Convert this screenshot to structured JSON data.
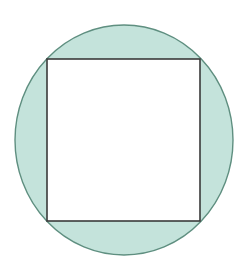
{
  "diagram": {
    "type": "inscribed-square-in-circle",
    "circle": {
      "cx": 124,
      "cy": 140,
      "rx": 109,
      "ry": 115,
      "fill": "#c4e3db",
      "stroke": "#5f8f80",
      "stroke_width": 1.4
    },
    "square": {
      "x": 47,
      "y": 59,
      "width": 153,
      "height": 162,
      "fill": "#ffffff",
      "stroke": "#3a3a3a",
      "stroke_width": 1.6
    },
    "background": "#ffffff"
  }
}
